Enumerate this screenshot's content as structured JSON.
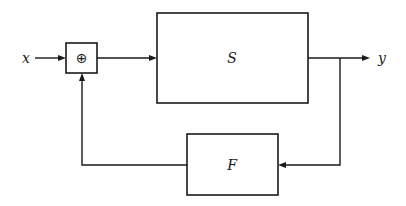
{
  "diagram": {
    "type": "feedback-loop block diagram",
    "input_label": "x",
    "output_label": "y",
    "summing_junction_symbol": "⊕",
    "forward_block_label": "S",
    "feedback_block_label": "F"
  },
  "edges": [
    {
      "from": "x",
      "to": "summing-junction"
    },
    {
      "from": "summing-junction",
      "to": "S"
    },
    {
      "from": "S",
      "to": "y"
    },
    {
      "from": "y",
      "to": "F"
    },
    {
      "from": "F",
      "to": "summing-junction"
    }
  ]
}
